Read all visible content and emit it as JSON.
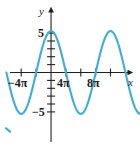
{
  "figure": {
    "title": "",
    "background": "#ffffff",
    "curve_color": "#3BAEDB",
    "axis_color": "#231f20",
    "label_color": "#1a1a1a"
  },
  "axis_labels": {
    "x_name": "x",
    "y_name": "y"
  },
  "tick_labels": {
    "x_neg_4pi": "−4π",
    "x_4pi": "4π",
    "x_8pi": "8π",
    "y_5": "5",
    "y_neg5": "−5"
  },
  "chart_data": {
    "type": "line",
    "title": "",
    "xlabel": "x",
    "ylabel": "y",
    "grid": false,
    "legend": null,
    "xlim": [
      -18.85,
      40.84
    ],
    "ylim": [
      -7.4,
      7.9
    ],
    "xticks": [
      -12.566,
      -6.283,
      0,
      6.283,
      12.566,
      18.85,
      25.133,
      31.416,
      37.699
    ],
    "xticklabels": [
      "−4π",
      "",
      "",
      "4π",
      "",
      "8π",
      "",
      "",
      ""
    ],
    "yticks": [
      -5,
      -4,
      -3,
      -2,
      -1,
      1,
      2,
      3,
      4,
      5
    ],
    "yticklabels": [
      "−5",
      "",
      "",
      "",
      "",
      "",
      "",
      "",
      "",
      "5"
    ],
    "function": "y = 5 cos(x/4)",
    "amplitude": 5,
    "period": 25.133,
    "series": [
      {
        "name": "y = 5 cos(x/4)",
        "color": "#3BAEDB",
        "x": [
          -18.85,
          -17.28,
          -15.71,
          -14.14,
          -12.57,
          -11.0,
          -9.42,
          -7.85,
          -6.28,
          -4.71,
          -3.14,
          -1.57,
          0.0,
          1.57,
          3.14,
          4.71,
          6.28,
          7.85,
          9.42,
          11.0,
          12.57,
          14.14,
          15.71,
          17.28,
          18.85,
          20.42,
          21.99,
          23.56,
          25.13,
          26.7,
          28.27,
          29.85,
          31.42,
          32.99,
          34.56,
          36.13,
          37.7,
          39.27,
          40.84
        ],
        "y": [
          -3.54,
          -4.62,
          -5.0,
          -4.62,
          -3.54,
          -1.91,
          0.0,
          1.91,
          3.54,
          4.62,
          5.0,
          4.62,
          5.0,
          4.62,
          3.54,
          1.91,
          0.0,
          -1.91,
          -3.54,
          -4.62,
          -5.0,
          -4.62,
          -3.54,
          -1.91,
          0.0,
          1.91,
          3.54,
          4.62,
          5.0,
          4.62,
          3.54,
          1.91,
          0.0,
          -1.91,
          -3.54,
          -4.62,
          -5.0,
          -4.62,
          -3.54
        ]
      }
    ],
    "arrowheads": {
      "x_axis_right": true,
      "y_axis_top": true,
      "curve_ends": true
    }
  }
}
